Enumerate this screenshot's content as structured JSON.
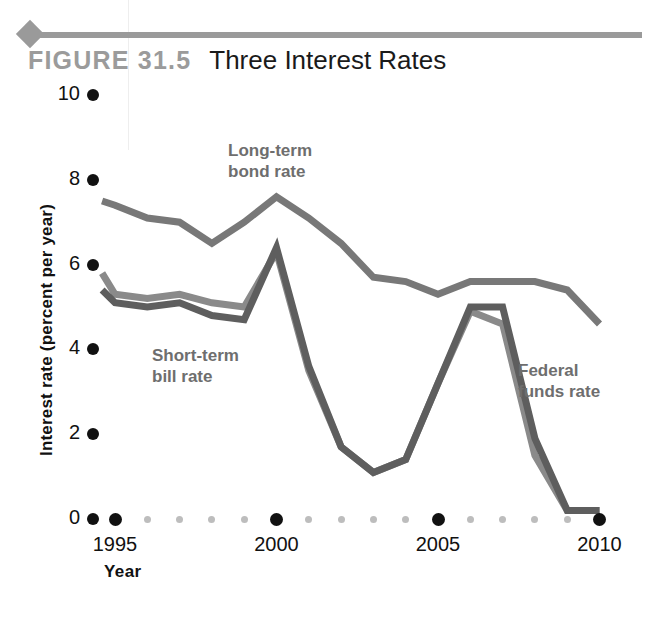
{
  "header": {
    "figure_number": "FIGURE 31.5",
    "figure_title": "Three Interest Rates"
  },
  "axes": {
    "y_axis_title": "Interest rate (percent per year)",
    "x_axis_title": "Year",
    "y_ticks": [
      "0",
      "2",
      "4",
      "6",
      "8",
      "10"
    ],
    "x_ticks": [
      "1995",
      "2000",
      "2005",
      "2010"
    ]
  },
  "annotations": {
    "long_term_bond": "Long-term\nbond rate",
    "short_term_bill": "Short-term\nbill rate",
    "federal_funds": "Federal\nfunds rate"
  },
  "colors": {
    "long_term_bond": "#787878",
    "short_term_bill": "#8a8a8a",
    "federal_funds": "#5e5e5e",
    "axis_text": "#111111",
    "annotation_text": "#6e6e6e",
    "figure_number": "#9b9b9b",
    "rule": "#9a9a9a",
    "minor_tick": "#bdbdbd"
  },
  "chart_data": {
    "type": "line",
    "title": "Three Interest Rates",
    "xlabel": "Year",
    "ylabel": "Interest rate (percent per year)",
    "xlim": [
      1994.3,
      2010.3
    ],
    "ylim": [
      0,
      10
    ],
    "grid": false,
    "legend": "inline-annotations",
    "x": [
      1994.5,
      1995,
      1996,
      1997,
      1998,
      1999,
      2000,
      2001,
      2002,
      2003,
      2004,
      2005,
      2006,
      2007,
      2008,
      2009,
      2010
    ],
    "series": [
      {
        "name": "Long-term bond rate",
        "color": "#787878",
        "x": [
          1994.6,
          1995,
          1996,
          1997,
          1998,
          1999,
          2000,
          2001,
          2002,
          2003,
          2004,
          2005,
          2006,
          2007,
          2008,
          2009,
          2010
        ],
        "values": [
          7.5,
          7.4,
          7.1,
          7.0,
          6.5,
          7.0,
          7.6,
          7.1,
          6.5,
          5.7,
          5.6,
          5.3,
          5.6,
          5.6,
          5.6,
          5.4,
          4.6
        ]
      },
      {
        "name": "Short-term bill rate",
        "color": "#8a8a8a",
        "x": [
          1994.6,
          1995,
          1996,
          1997,
          1998,
          1999,
          2000,
          2001,
          2002,
          2003,
          2004,
          2005,
          2006,
          2007,
          2008,
          2009,
          2010
        ],
        "values": [
          5.8,
          5.3,
          5.2,
          5.3,
          5.1,
          5.0,
          6.3,
          3.5,
          1.7,
          1.1,
          1.4,
          3.2,
          4.9,
          4.6,
          1.5,
          0.2,
          0.2
        ]
      },
      {
        "name": "Federal funds rate",
        "color": "#5e5e5e",
        "x": [
          1994.6,
          1995,
          1996,
          1997,
          1998,
          1999,
          2000,
          2001,
          2002,
          2003,
          2004,
          2005,
          2006,
          2007,
          2008,
          2009,
          2010
        ],
        "values": [
          5.4,
          5.1,
          5.0,
          5.1,
          4.8,
          4.7,
          6.4,
          3.6,
          1.7,
          1.1,
          1.4,
          3.2,
          5.0,
          5.0,
          1.9,
          0.2,
          0.2
        ]
      }
    ]
  }
}
